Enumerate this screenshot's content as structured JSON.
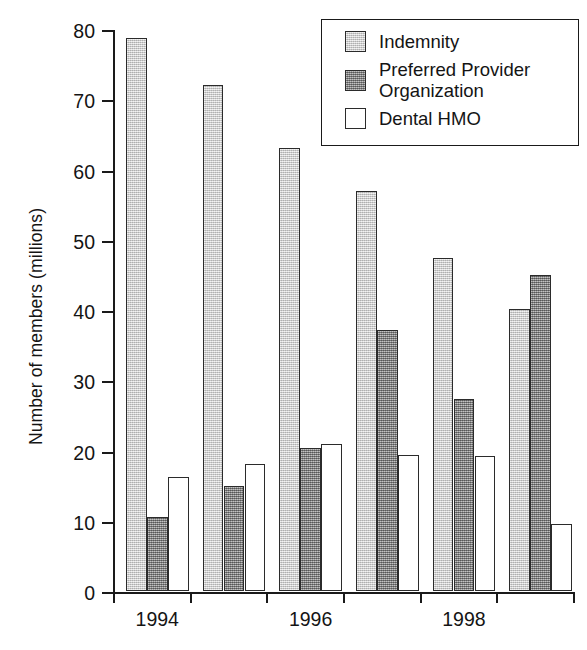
{
  "chart_data": {
    "type": "bar",
    "title": "",
    "subtitle": "",
    "xlabel": "",
    "ylabel": "Number of members (millions)",
    "categories": [
      "1994",
      "1995",
      "1996",
      "1997",
      "1998",
      "1999"
    ],
    "tick_labels_visible": [
      "1994",
      "1996",
      "1998"
    ],
    "series": [
      {
        "name": "Indemnity",
        "color": "#cfcfcf",
        "values": [
          78.7,
          72.0,
          63.1,
          57.0,
          47.4,
          40.1
        ]
      },
      {
        "name": "Preferred Provider\nOrganization",
        "color": "#8a8a8a",
        "values": [
          10.6,
          15.0,
          20.3,
          37.1,
          27.3,
          45.0
        ]
      },
      {
        "name": "Dental HMO",
        "color": "#ffffff",
        "values": [
          16.2,
          18.1,
          20.9,
          19.3,
          19.2,
          9.6
        ]
      }
    ],
    "ylim": [
      0,
      80
    ],
    "y_ticks": [
      0,
      10,
      20,
      30,
      40,
      50,
      60,
      70,
      80
    ],
    "y_tick_labels": [
      "0",
      "10",
      "20",
      "30",
      "40",
      "50",
      "60",
      "70",
      "80"
    ],
    "grid": false,
    "legend_position": "top-right",
    "legend_entries": [
      "Indemnity",
      "Preferred Provider\nOrganization",
      "Dental HMO"
    ],
    "annotations": []
  },
  "axis": {
    "y_title": "Number of members (millions)"
  }
}
